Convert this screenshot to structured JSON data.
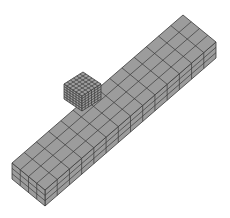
{
  "figure": {
    "colors": {
      "face_fill": "#9c9c9c",
      "mesh_line": "#3a3a3a",
      "background": "#ffffff"
    },
    "beam": {
      "top_divisions_length": 14,
      "top_divisions_width": 4,
      "depth_divisions": 3
    },
    "cube": {
      "divisions": 6
    }
  }
}
